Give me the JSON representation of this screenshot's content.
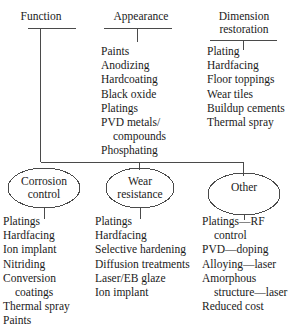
{
  "diagram": {
    "type": "tree-diagram",
    "line_color": "#4a4a4a",
    "text_color": "#1a1a1a",
    "columns": [
      {
        "header": "Function",
        "items": []
      },
      {
        "header": "Appearance",
        "items": [
          {
            "text": "Paints",
            "continuation": false
          },
          {
            "text": "Anodizing",
            "continuation": false
          },
          {
            "text": "Hardcoating",
            "continuation": false
          },
          {
            "text": "Black oxide",
            "continuation": false
          },
          {
            "text": "Platings",
            "continuation": false
          },
          {
            "text": "PVD metals/",
            "continuation": false
          },
          {
            "text": "compounds",
            "continuation": true
          },
          {
            "text": "Phosphating",
            "continuation": false
          }
        ]
      },
      {
        "header": "Dimension\nrestoration",
        "items": [
          {
            "text": "Plating",
            "continuation": false
          },
          {
            "text": "Hardfacing",
            "continuation": false
          },
          {
            "text": "Floor toppings",
            "continuation": false
          },
          {
            "text": "Wear tiles",
            "continuation": false
          },
          {
            "text": "Buildup cements",
            "continuation": false
          },
          {
            "text": "Thermal spray",
            "continuation": false
          }
        ]
      }
    ],
    "nodes": [
      {
        "label": "Corrosion\ncontrol",
        "items": [
          {
            "text": "Platings",
            "continuation": false
          },
          {
            "text": "Hardfacing",
            "continuation": false
          },
          {
            "text": "Ion implant",
            "continuation": false
          },
          {
            "text": "Nitriding",
            "continuation": false
          },
          {
            "text": "Conversion",
            "continuation": false
          },
          {
            "text": "coatings",
            "continuation": true
          },
          {
            "text": "Thermal spray",
            "continuation": false
          },
          {
            "text": "Paints",
            "continuation": false
          }
        ]
      },
      {
        "label": "Wear\nresistance",
        "items": [
          {
            "text": "Platings",
            "continuation": false
          },
          {
            "text": "Hardfacing",
            "continuation": false
          },
          {
            "text": "Selective hardening",
            "continuation": false
          },
          {
            "text": "Diffusion treatments",
            "continuation": false
          },
          {
            "text": "Laser/EB glaze",
            "continuation": false
          },
          {
            "text": "Ion implant",
            "continuation": false
          }
        ]
      },
      {
        "label": "Other",
        "items": [
          {
            "text": "Platings—RF",
            "continuation": false
          },
          {
            "text": "control",
            "continuation": true
          },
          {
            "text": "PVD—doping",
            "continuation": false
          },
          {
            "text": "Alloying—laser",
            "continuation": false
          },
          {
            "text": "Amorphous",
            "continuation": false
          },
          {
            "text": "structure—laser",
            "continuation": true
          },
          {
            "text": "Reduced cost",
            "continuation": false
          }
        ]
      }
    ]
  }
}
